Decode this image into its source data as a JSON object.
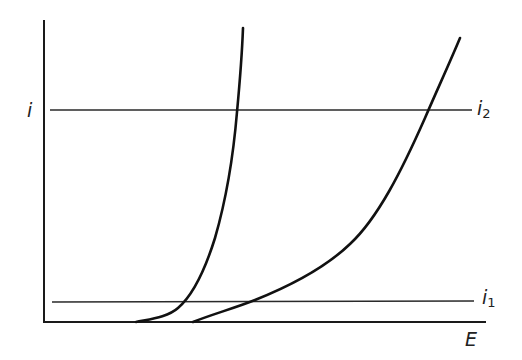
{
  "diagram": {
    "type": "current-potential curves",
    "axes": {
      "y_label": "i",
      "x_label": "E"
    },
    "levels": [
      {
        "id": "i2",
        "symbol": "i",
        "subscript": "2",
        "position": "upper"
      },
      {
        "id": "i1",
        "symbol": "i",
        "subscript": "1",
        "position": "lower"
      }
    ],
    "curves": [
      {
        "id": "curve-left",
        "description": "steep curve rising sharply, onset at lower E"
      },
      {
        "id": "curve-right",
        "description": "gradual curve rising, onset at higher E"
      }
    ],
    "colors": {
      "background": "#ffffff",
      "ink": "#111111"
    }
  }
}
